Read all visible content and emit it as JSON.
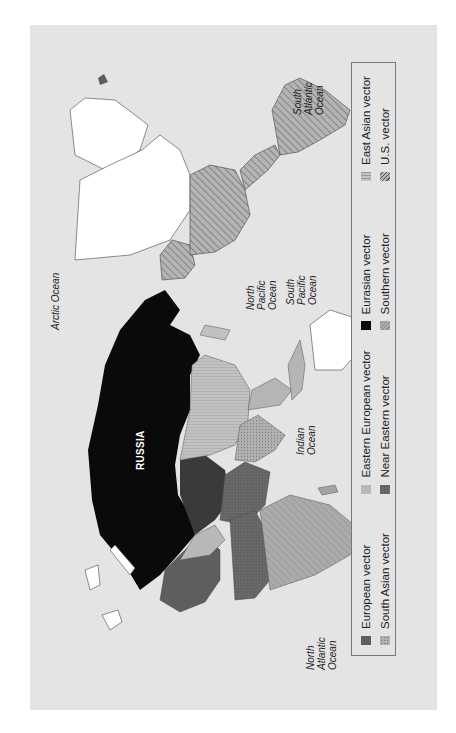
{
  "figure": {
    "orientation": "rotated-90-ccw",
    "background_color": "#e4e4e4"
  },
  "map": {
    "country_labels": {
      "russia": "RUSSIA"
    },
    "ocean_labels": {
      "arctic": "Arctic Ocean",
      "north_atlantic": [
        "North",
        "Atlantic",
        "Ocean"
      ],
      "north_pacific": [
        "North",
        "Pacific",
        "Ocean"
      ],
      "south_pacific": [
        "South",
        "Pacific",
        "Ocean"
      ],
      "south_atlantic": [
        "South",
        "Atlantic",
        "Ocean"
      ],
      "indian": [
        "Indian",
        "Ocean"
      ]
    },
    "colors": {
      "eurasian": "#0a0a0a",
      "european": "#5e5e5e",
      "eastern_european": "#b8b8b8",
      "south_asian": "#a8a8a8",
      "near_eastern": "#6e6e6e",
      "southern": "#a4a4a4",
      "east_asian": "#bdbdbd",
      "us": "#a0a0a0",
      "unassigned": "#ffffff",
      "ocean": "#e4e4e4"
    }
  },
  "legend": {
    "items": [
      {
        "label": "European vector",
        "swatch": "solid-dark"
      },
      {
        "label": "Eastern European vector",
        "swatch": "solid-light"
      },
      {
        "label": "Eurasian vector",
        "swatch": "solid-black"
      },
      {
        "label": "East Asian vector",
        "swatch": "vertical-lines"
      },
      {
        "label": "South Asian vector",
        "swatch": "dotted"
      },
      {
        "label": "Near Eastern vector",
        "swatch": "dark-textured"
      },
      {
        "label": "Southern vector",
        "swatch": "diagonal-light"
      },
      {
        "label": "U.S. vector",
        "swatch": "diagonal-hatch"
      }
    ]
  }
}
